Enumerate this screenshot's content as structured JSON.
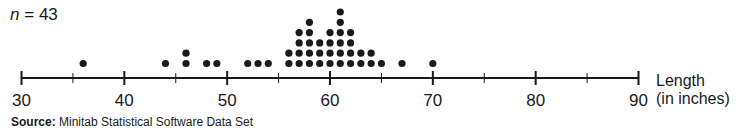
{
  "sample_label": {
    "variable": "n",
    "equals": "=",
    "value": "43"
  },
  "axis": {
    "title_line1": "Length",
    "title_line2": "(in inches)",
    "min": 30,
    "max": 90,
    "major_ticks": [
      30,
      40,
      50,
      60,
      70,
      80,
      90
    ],
    "minor_ticks": [
      35,
      45,
      55,
      65,
      75,
      85
    ]
  },
  "source": {
    "label": "Source:",
    "text": "Minitab Statistical Software Data Set"
  },
  "chart_data": {
    "type": "dot_plot",
    "title": "",
    "annotation": "n = 43",
    "xlabel": "Length (in inches)",
    "ylabel": "",
    "xlim": [
      30,
      90
    ],
    "x_ticks": [
      30,
      40,
      50,
      60,
      70,
      80,
      90
    ],
    "grid": false,
    "points": [
      {
        "x": 36,
        "count": 1
      },
      {
        "x": 44,
        "count": 1
      },
      {
        "x": 46,
        "count": 2
      },
      {
        "x": 48,
        "count": 1
      },
      {
        "x": 49,
        "count": 1
      },
      {
        "x": 52,
        "count": 1
      },
      {
        "x": 53,
        "count": 1
      },
      {
        "x": 54,
        "count": 1
      },
      {
        "x": 56,
        "count": 2
      },
      {
        "x": 57,
        "count": 4
      },
      {
        "x": 58,
        "count": 5
      },
      {
        "x": 59,
        "count": 3
      },
      {
        "x": 60,
        "count": 4
      },
      {
        "x": 61,
        "count": 6
      },
      {
        "x": 62,
        "count": 4
      },
      {
        "x": 63,
        "count": 2
      },
      {
        "x": 64,
        "count": 2
      },
      {
        "x": 65,
        "count": 1
      },
      {
        "x": 67,
        "count": 1
      },
      {
        "x": 70,
        "count": 1
      }
    ],
    "source": "Minitab Statistical Software Data Set"
  },
  "colors": {
    "ink": "#1a1a1a",
    "background": "#ffffff"
  }
}
